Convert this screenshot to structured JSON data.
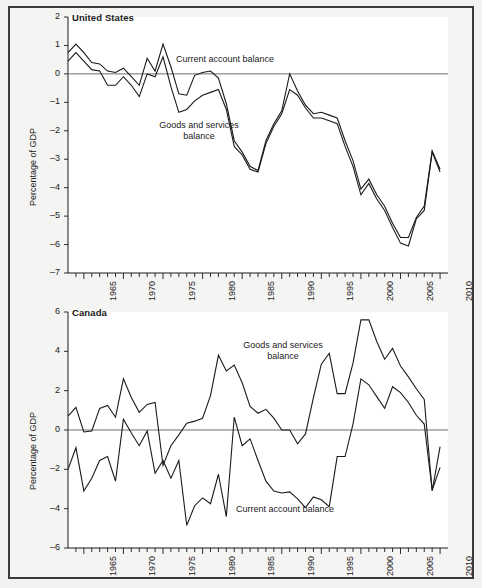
{
  "figure": {
    "background_color": "#f4f4f2",
    "frame_color": "#3a3a3a",
    "line_color": "#1a1a1a",
    "zero_line_color": "#6e6e6e"
  },
  "panels": [
    {
      "id": "united-states",
      "title": "United States",
      "ylabel": "Percentage of GDP",
      "yticks": [
        2,
        1,
        0,
        -1,
        -2,
        -3,
        -4,
        -5,
        -6,
        -7
      ],
      "ytick_labels": [
        "2",
        "1",
        "0",
        "–1",
        "–2",
        "–3",
        "–4",
        "–5",
        "–6",
        "–7"
      ],
      "xtick_labels": [
        "1965",
        "1970",
        "1975",
        "1980",
        "1985",
        "1990",
        "1995",
        "2000",
        "2005",
        "2010"
      ],
      "annotations": [
        {
          "name": "current-account-balance-label",
          "text": "Current account balance"
        },
        {
          "name": "goods-and-services-balance-label",
          "text": "Goods and services\nbalance"
        }
      ]
    },
    {
      "id": "canada",
      "title": "Canada",
      "ylabel": "Percentage of GDP",
      "yticks": [
        6,
        4,
        2,
        0,
        -2,
        -4,
        -6
      ],
      "ytick_labels": [
        "6",
        "4",
        "2",
        "0",
        "–2",
        "–4",
        "–6"
      ],
      "xtick_labels": [
        "1965",
        "1970",
        "1975",
        "1980",
        "1985",
        "1990",
        "1995",
        "2000",
        "2005",
        "2010"
      ],
      "annotations": [
        {
          "name": "goods-and-services-balance-label",
          "text": "Goods and services\nbalance"
        },
        {
          "name": "current-account-balance-label",
          "text": "Current account balance"
        }
      ]
    }
  ],
  "chart_data": [
    {
      "type": "line",
      "panel": "United States",
      "title": "United States",
      "xlabel": "",
      "ylabel": "Percentage of GDP",
      "xlim": [
        1963,
        2011
      ],
      "ylim": [
        -7,
        2
      ],
      "grid": false,
      "legend": "inline-annotations",
      "x": [
        1963,
        1964,
        1965,
        1966,
        1967,
        1968,
        1969,
        1970,
        1971,
        1972,
        1973,
        1974,
        1975,
        1976,
        1977,
        1978,
        1979,
        1980,
        1981,
        1982,
        1983,
        1984,
        1985,
        1986,
        1987,
        1988,
        1989,
        1990,
        1991,
        1992,
        1993,
        1994,
        1995,
        1996,
        1997,
        1998,
        1999,
        2000,
        2001,
        2002,
        2003,
        2004,
        2005,
        2006,
        2007,
        2008,
        2009,
        2010
      ],
      "series": [
        {
          "name": "Current account balance",
          "values": [
            0.75,
            1.05,
            0.75,
            0.4,
            0.35,
            0.1,
            0.05,
            0.2,
            -0.1,
            -0.4,
            0.55,
            0.1,
            1.05,
            0.25,
            -0.7,
            -0.75,
            -0.05,
            0.05,
            0.1,
            -0.15,
            -1.05,
            -2.35,
            -2.75,
            -3.25,
            -3.4,
            -2.35,
            -1.75,
            -1.3,
            0.0,
            -0.6,
            -1.1,
            -1.4,
            -1.35,
            -1.45,
            -1.55,
            -2.35,
            -3.05,
            -4.05,
            -3.7,
            -4.25,
            -4.65,
            -5.25,
            -5.75,
            -5.75,
            -5.05,
            -4.65,
            -2.7,
            -3.35
          ]
        },
        {
          "name": "Goods and services balance",
          "values": [
            0.45,
            0.75,
            0.45,
            0.15,
            0.1,
            -0.4,
            -0.4,
            -0.1,
            -0.4,
            -0.8,
            0.0,
            -0.1,
            0.6,
            -0.45,
            -1.35,
            -1.25,
            -0.95,
            -0.75,
            -0.65,
            -0.55,
            -1.25,
            -2.55,
            -2.85,
            -3.35,
            -3.45,
            -2.45,
            -1.85,
            -1.4,
            -0.55,
            -0.75,
            -1.2,
            -1.55,
            -1.55,
            -1.65,
            -1.75,
            -2.55,
            -3.25,
            -4.25,
            -3.85,
            -4.4,
            -4.8,
            -5.4,
            -5.95,
            -6.05,
            -5.1,
            -4.8,
            -2.75,
            -3.45
          ]
        }
      ]
    },
    {
      "type": "line",
      "panel": "Canada",
      "title": "Canada",
      "xlabel": "",
      "ylabel": "Percentage of GDP",
      "xlim": [
        1963,
        2011
      ],
      "ylim": [
        -6,
        6
      ],
      "grid": false,
      "legend": "inline-annotations",
      "x": [
        1963,
        1964,
        1965,
        1966,
        1967,
        1968,
        1969,
        1970,
        1971,
        1972,
        1973,
        1974,
        1975,
        1976,
        1977,
        1978,
        1979,
        1980,
        1981,
        1982,
        1983,
        1984,
        1985,
        1986,
        1987,
        1988,
        1989,
        1990,
        1991,
        1992,
        1993,
        1994,
        1995,
        1996,
        1997,
        1998,
        1999,
        2000,
        2001,
        2002,
        2003,
        2004,
        2005,
        2006,
        2007,
        2008,
        2009,
        2010
      ],
      "series": [
        {
          "name": "Goods and services balance",
          "values": [
            0.7,
            1.15,
            -0.1,
            -0.05,
            1.1,
            1.25,
            0.65,
            2.6,
            1.65,
            0.9,
            1.3,
            1.4,
            -1.8,
            -0.8,
            -0.25,
            0.35,
            0.45,
            0.6,
            1.75,
            3.8,
            3.0,
            3.3,
            2.4,
            1.2,
            0.85,
            1.05,
            0.6,
            0.0,
            0.0,
            -0.7,
            -0.2,
            1.65,
            3.35,
            3.9,
            1.85,
            1.85,
            3.4,
            5.6,
            5.6,
            4.5,
            3.6,
            4.15,
            3.25,
            2.7,
            2.1,
            1.55,
            -3.1,
            -0.85
          ]
        },
        {
          "name": "Current account balance",
          "values": [
            -2.0,
            -0.9,
            -3.1,
            -2.45,
            -1.55,
            -1.35,
            -2.6,
            0.55,
            -0.15,
            -0.8,
            -0.05,
            -2.2,
            -1.55,
            -2.45,
            -1.55,
            -4.85,
            -3.85,
            -3.45,
            -3.75,
            -2.25,
            -4.4,
            0.65,
            -0.8,
            -0.45,
            -1.55,
            -2.6,
            -3.1,
            -3.2,
            -3.15,
            -3.5,
            -3.95,
            -3.4,
            -3.55,
            -3.9,
            -1.35,
            -1.35,
            0.3,
            2.6,
            2.3,
            1.7,
            1.1,
            2.2,
            1.9,
            1.4,
            0.75,
            0.3,
            -3.05,
            -1.9
          ]
        }
      ]
    }
  ]
}
